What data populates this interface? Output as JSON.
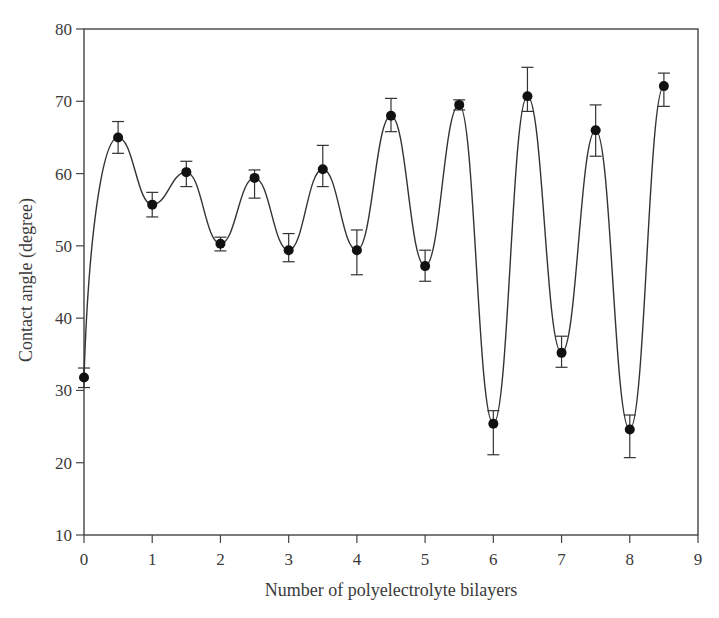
{
  "chart_data": {
    "type": "line",
    "title": "",
    "xlabel": "Number of polyelectrolyte bilayers",
    "ylabel": "Contact angle (degree)",
    "xlim": [
      0,
      9
    ],
    "ylim": [
      10,
      80
    ],
    "xticks": [
      0,
      1,
      2,
      3,
      4,
      5,
      6,
      7,
      8,
      9
    ],
    "yticks": [
      10,
      20,
      30,
      40,
      50,
      60,
      70,
      80
    ],
    "grid": false,
    "legend": null,
    "series": [
      {
        "name": "Contact angle",
        "marker": "filled-circle",
        "line": "smooth-spline",
        "x": [
          0,
          0.5,
          1,
          1.5,
          2,
          2.5,
          3,
          3.5,
          4,
          4.5,
          5,
          5.5,
          6,
          6.5,
          7,
          7.5,
          8,
          8.5
        ],
        "y": [
          31.8,
          65.0,
          55.7,
          60.2,
          50.3,
          59.4,
          49.4,
          60.6,
          49.4,
          68.0,
          47.2,
          69.5,
          25.4,
          70.7,
          35.2,
          66.0,
          24.6,
          72.1
        ],
        "error_upper": [
          33.1,
          67.2,
          57.4,
          61.7,
          51.2,
          60.5,
          51.7,
          63.9,
          52.2,
          70.4,
          49.4,
          70.2,
          27.2,
          74.7,
          37.5,
          69.5,
          26.6,
          73.9
        ],
        "error_lower": [
          30.4,
          62.8,
          54.0,
          58.2,
          49.3,
          56.6,
          47.8,
          58.2,
          46.0,
          65.8,
          45.1,
          68.8,
          21.1,
          68.6,
          33.2,
          62.4,
          20.7,
          69.3
        ]
      }
    ]
  },
  "axes": {
    "x_label": "Number of polyelectrolyte bilayers",
    "y_label": "Contact angle (degree)",
    "x_tick_labels": [
      "0",
      "1",
      "2",
      "3",
      "4",
      "5",
      "6",
      "7",
      "8",
      "9"
    ],
    "y_tick_labels": [
      "10",
      "20",
      "30",
      "40",
      "50",
      "60",
      "70",
      "80"
    ]
  },
  "colors": {
    "line": "#333333",
    "marker": "#111111",
    "axis": "#444444"
  }
}
